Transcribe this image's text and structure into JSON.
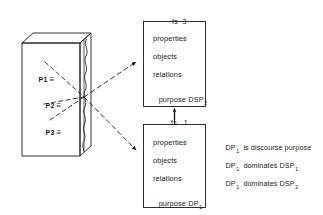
{
  "figure": {
    "background_color": "#ffffff",
    "ink_color": "#1a1a1a"
  },
  "document_block": {
    "name": "discourse-text-block",
    "segments": [
      {
        "id": "p1",
        "label": "P1",
        "relation_symbol": "≡"
      },
      {
        "id": "p2",
        "label": "P2",
        "relation_symbol": "≡"
      },
      {
        "id": "p3",
        "label": "P3",
        "relation_symbol": "≡"
      }
    ],
    "edge_marking": "wavy-line"
  },
  "feature_structures": [
    {
      "id": "fs3",
      "tag_prefix": "fs",
      "tag_number": "3",
      "slots": [
        {
          "name": "properties",
          "label": "properties",
          "value": ""
        },
        {
          "name": "objects",
          "label": "objects",
          "value": ""
        },
        {
          "name": "relations",
          "label": "relations",
          "value": ""
        },
        {
          "name": "purpose",
          "label": "purpose",
          "value": "DSP",
          "value_subscript": "2"
        }
      ]
    },
    {
      "id": "fs1",
      "tag_prefix": "fs",
      "tag_number": "1",
      "slots": [
        {
          "name": "properties",
          "label": "properties",
          "value": ""
        },
        {
          "name": "objects",
          "label": "objects",
          "value": ""
        },
        {
          "name": "relations",
          "label": "relations",
          "value": ""
        },
        {
          "name": "purpose",
          "label": "purpose",
          "value": "DP",
          "value_subscript": "1"
        }
      ]
    }
  ],
  "connectors": {
    "dashed_arrow_upper": {
      "label": "",
      "style": "dashed",
      "head": "filled"
    },
    "dashed_arrow_lower": {
      "label": "",
      "style": "dashed",
      "head": "filled"
    },
    "vertical_arrow": {
      "label": "fs 1",
      "style": "solid",
      "head": "filled",
      "direction": "up"
    }
  },
  "statements": [
    {
      "subject": "DP",
      "subject_subscript": "1",
      "predicate": "is discourse purpose",
      "object": "",
      "object_subscript": ""
    },
    {
      "subject": "DP",
      "subject_subscript": "1",
      "predicate": "dominates",
      "object": "DSP",
      "object_subscript": "1"
    },
    {
      "subject": "DP",
      "subject_subscript": "1",
      "predicate": "dominates",
      "object": "DSP",
      "object_subscript": "2"
    }
  ]
}
